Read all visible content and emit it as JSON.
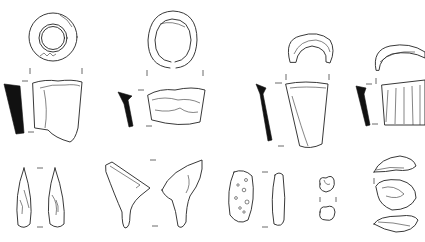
{
  "figure": {
    "type": "archaeological-artifact-line-drawings",
    "background": "#ffffff",
    "ink_color": "#111111",
    "rows": [
      {
        "row": "top",
        "items": [
          "ring-top-view-1",
          "ring-top-view-2",
          "fragment-top-view-3",
          "fragment-top-view-4"
        ]
      },
      {
        "row": "middle",
        "items": [
          "vessel-profile-1",
          "vessel-profile-2",
          "vessel-profile-3",
          "vessel-profile-4"
        ]
      },
      {
        "row": "bottom",
        "items": [
          "pendant-pair-1",
          "pendant-pair-2",
          "oval-pebble-pair",
          "small-bead-pair",
          "shell-fragment-stack"
        ]
      }
    ]
  }
}
